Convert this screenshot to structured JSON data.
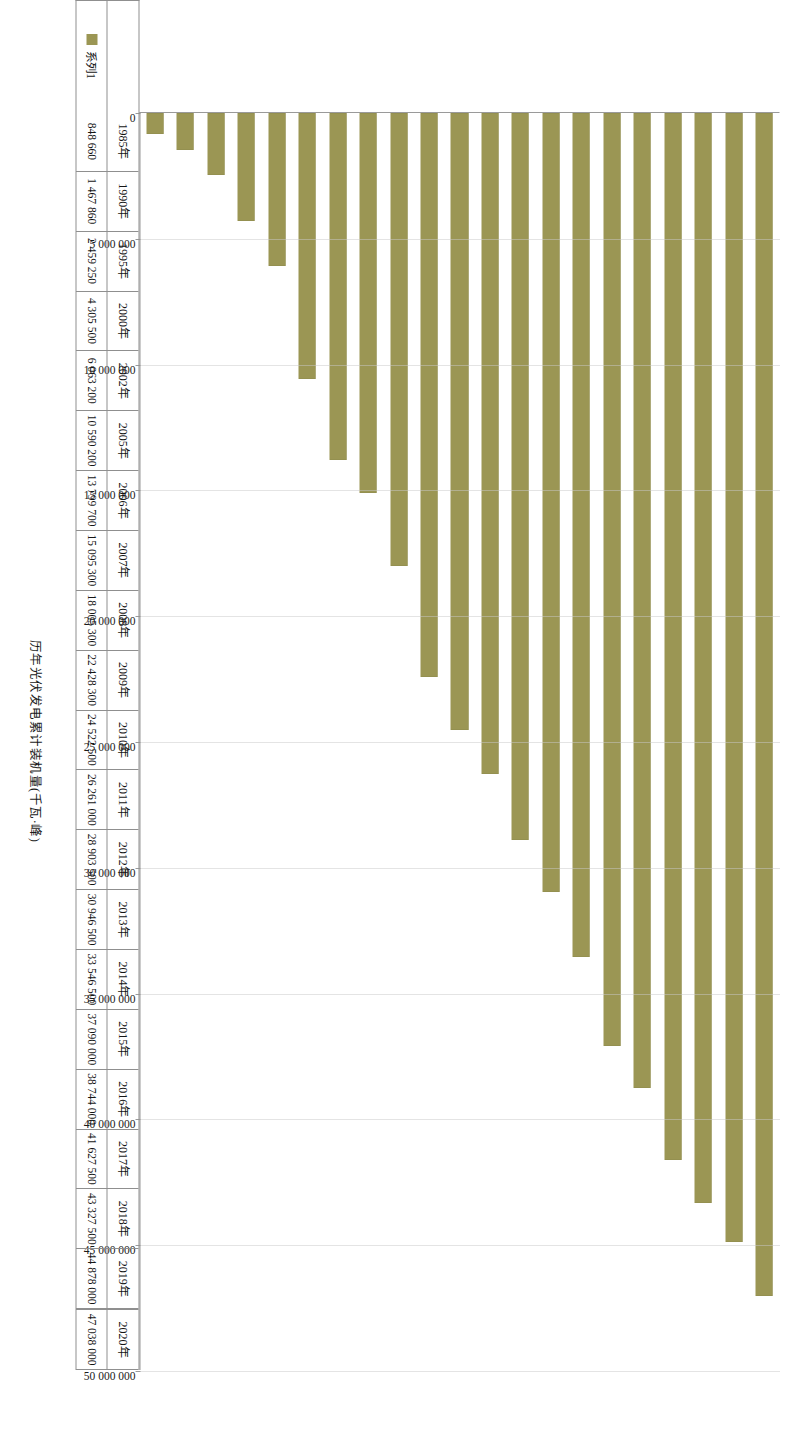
{
  "chart_data": {
    "type": "bar",
    "orientation": "horizontal",
    "title": "",
    "xlabel": "",
    "ylabel": "历年光伏发电累计装机量(千瓦·峰)",
    "axis_title": "历年光伏发电累计装机量(千瓦·峰)",
    "series_name": "系列1",
    "bar_color": "#9b9654",
    "grid": true,
    "legend_position": "bottom-left",
    "xlim": [
      0,
      50000000
    ],
    "tick_labels": [
      "0",
      "5 000 000",
      "10 000 000",
      "15 000 000",
      "20 000 000",
      "25 000 000",
      "30 000 000",
      "35 000 000",
      "40 000 000",
      "45 000 000",
      "50 000 000"
    ],
    "tick_values": [
      0,
      5000000,
      10000000,
      15000000,
      20000000,
      25000000,
      30000000,
      35000000,
      40000000,
      45000000,
      50000000
    ],
    "categories": [
      "1985年",
      "1990年",
      "1995年",
      "2000年",
      "2002年",
      "2005年",
      "2006年",
      "2007年",
      "2008年",
      "2009年",
      "2010年",
      "2011年",
      "2012年",
      "2013年",
      "2014年",
      "2015年",
      "2016年",
      "2017年",
      "2018年",
      "2019年",
      "2020年"
    ],
    "value_labels": [
      "848 660",
      "1 467 860",
      "2 459 250",
      "4 305 500",
      "6 063 200",
      "10 590 200",
      "13 799 700",
      "15 095 300",
      "18 005 300",
      "22 428 300",
      "24 522 500",
      "26 261 000",
      "28 903 500",
      "30 946 500",
      "33 546 500",
      "37 090 000",
      "38 744 000",
      "41 627 500",
      "43 327 500",
      "44 878 000",
      "47 038 000"
    ],
    "values": [
      848660,
      1467860,
      2459250,
      4305500,
      6063200,
      10590200,
      13799700,
      15095300,
      18005300,
      22428300,
      24522500,
      26261000,
      28903500,
      30946500,
      33546500,
      37090000,
      38744000,
      41627500,
      43327500,
      44878000,
      47038000
    ]
  }
}
